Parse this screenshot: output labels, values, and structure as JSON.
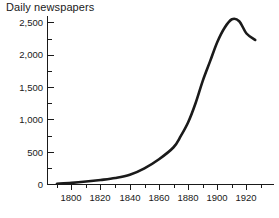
{
  "chart_data": {
    "type": "line",
    "title": "Daily newspapers",
    "xlabel": "",
    "ylabel": "",
    "grid": false,
    "legend": false,
    "xlim": [
      1790,
      1930
    ],
    "ylim": [
      0,
      2700
    ],
    "y_ticks": [
      0,
      500,
      1000,
      1500,
      2000,
      2500
    ],
    "y_tick_labels": [
      "0",
      "500",
      "1,000",
      "1,500",
      "2,000",
      "2,500"
    ],
    "y_minor_ticks": [
      250,
      750,
      1250,
      1750,
      2250
    ],
    "x_ticks": [
      1800,
      1820,
      1840,
      1860,
      1880,
      1900,
      1920
    ],
    "x_tick_labels": [
      "1800",
      "1820",
      "1840",
      "1860",
      "1880",
      "1900",
      "1920"
    ],
    "x_minor_ticks": [
      1790,
      1810,
      1830,
      1850,
      1870,
      1890,
      1910,
      1930
    ],
    "series": [
      {
        "name": "Daily newspapers",
        "color": "#1a1a1a",
        "x": [
          1790,
          1800,
          1810,
          1820,
          1830,
          1840,
          1850,
          1860,
          1870,
          1875,
          1880,
          1885,
          1890,
          1895,
          1900,
          1905,
          1910,
          1915,
          1920,
          1926
        ],
        "values": [
          12,
          25,
          45,
          70,
          100,
          150,
          250,
          390,
          575,
          750,
          960,
          1250,
          1600,
          1900,
          2200,
          2420,
          2550,
          2520,
          2330,
          2230
        ]
      }
    ]
  },
  "axis": {
    "title": "Daily newspapers"
  }
}
